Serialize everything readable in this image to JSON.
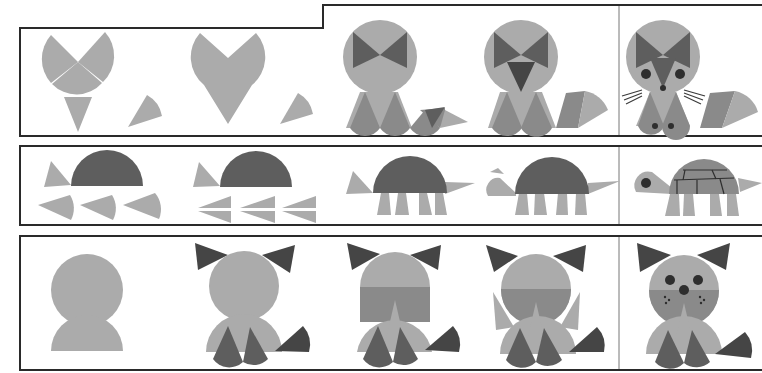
{
  "colors": {
    "background": "#ffffff",
    "frame": "#2a2a2a",
    "light": "#ababab",
    "mid": "#8a8a8a",
    "dark": "#5e5e5e",
    "darker": "#454545",
    "ink": "#2e2e2e"
  },
  "rows": [
    {
      "name": "fox",
      "steps": 5
    },
    {
      "name": "turtle",
      "steps": 5
    },
    {
      "name": "cat",
      "steps": 5
    }
  ]
}
